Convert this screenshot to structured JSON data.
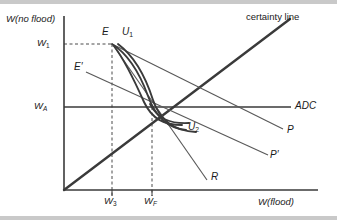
{
  "figure": {
    "domain": "diagram",
    "kind": "state-contingent-wealth-indifference-diagram",
    "background": "#ffffff",
    "ink": "#333333",
    "edge_band": "#c9c9c9"
  },
  "axes": {
    "y_title": "W(no flood)",
    "x_title": "W(flood)",
    "y_ticks": [
      {
        "id": "w1",
        "label": "W",
        "sub": "1",
        "y_px": 44
      },
      {
        "id": "wa",
        "label": "W",
        "sub": "A",
        "y_px": 107
      }
    ],
    "x_ticks": [
      {
        "id": "w3",
        "label": "W",
        "sub": "3",
        "x_px": 112
      },
      {
        "id": "wf",
        "label": "W",
        "sub": "F",
        "x_px": 152
      }
    ],
    "origin_px": {
      "x": 64,
      "y": 190
    },
    "x_axis_end_px": 300,
    "y_axis_top_px": 16
  },
  "points": [
    {
      "id": "E",
      "label": "E",
      "prime": false,
      "x_px": 112,
      "y_px": 44,
      "label_x": 102,
      "label_y": 27
    },
    {
      "id": "Eprime",
      "label": "E",
      "prime": true,
      "x_px": 93,
      "y_px": 75,
      "label_x": 75,
      "label_y": 62
    }
  ],
  "curves": [
    {
      "id": "U1",
      "label": "U",
      "sub": "1",
      "label_x": 123,
      "label_y": 27,
      "type": "indifference-curve",
      "stroke": "#3a3a3a",
      "width": 1.8
    },
    {
      "id": "U2",
      "label": "U",
      "sub": "2",
      "label_x": 190,
      "label_y": 122,
      "type": "indifference-curve",
      "stroke": "#3a3a3a",
      "width": 1.8
    }
  ],
  "lines": [
    {
      "id": "certainty-line",
      "label": "certainty line",
      "italic": false,
      "label_x": 248,
      "label_y": 14,
      "stroke": "#3a3a3a",
      "width": 2.2,
      "from_px": {
        "x": 64,
        "y": 190
      },
      "to_px": {
        "x": 290,
        "y": 19
      }
    },
    {
      "id": "ADC",
      "label": "ADC",
      "italic": true,
      "label_x": 296,
      "label_y": 102,
      "stroke": "#3a3a3a",
      "width": 1.5,
      "from_px": {
        "x": 64,
        "y": 107
      },
      "to_px": {
        "x": 291,
        "y": 107
      }
    },
    {
      "id": "P",
      "label": "P",
      "italic": true,
      "label_x": 288,
      "label_y": 126,
      "stroke": "#555555",
      "width": 1.2,
      "from_px": {
        "x": 112,
        "y": 44
      },
      "to_px": {
        "x": 283,
        "y": 129
      }
    },
    {
      "id": "Pprime",
      "label": "P",
      "italic": true,
      "prime": true,
      "label_x": 272,
      "label_y": 152,
      "stroke": "#555555",
      "width": 1.2,
      "from_px": {
        "x": 86,
        "y": 72
      },
      "to_px": {
        "x": 268,
        "y": 155
      }
    },
    {
      "id": "R",
      "label": "R",
      "italic": true,
      "label_x": 211,
      "label_y": 173,
      "stroke": "#555555",
      "width": 1.2,
      "from_px": {
        "x": 113,
        "y": 45
      },
      "to_px": {
        "x": 207,
        "y": 180
      }
    }
  ],
  "dashed_guides": [
    {
      "id": "w1-guide",
      "from_px": {
        "x": 64,
        "y": 44
      },
      "to_px": {
        "x": 112,
        "y": 44
      }
    },
    {
      "id": "w3-guide",
      "from_px": {
        "x": 112,
        "y": 44
      },
      "to_px": {
        "x": 112,
        "y": 196
      }
    },
    {
      "id": "wf-guide",
      "from_px": {
        "x": 152,
        "y": 107
      },
      "to_px": {
        "x": 152,
        "y": 196
      }
    }
  ]
}
